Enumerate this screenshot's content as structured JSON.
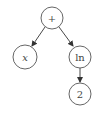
{
  "diagram": {
    "type": "expression-tree",
    "nodes": [
      {
        "id": "root",
        "label": "+",
        "italic": false,
        "cx": 52,
        "cy": 18,
        "r": 11
      },
      {
        "id": "x",
        "label": "x",
        "italic": true,
        "cx": 25,
        "cy": 57,
        "r": 12
      },
      {
        "id": "ln",
        "label": "ln",
        "italic": false,
        "cx": 80,
        "cy": 57,
        "r": 11
      },
      {
        "id": "two",
        "label": "2",
        "italic": false,
        "cx": 80,
        "cy": 94,
        "r": 11
      }
    ],
    "edges": [
      {
        "from": "root",
        "to": "x"
      },
      {
        "from": "root",
        "to": "ln"
      },
      {
        "from": "ln",
        "to": "two"
      }
    ]
  },
  "colors": {
    "stroke": "#555555",
    "text": "#444444",
    "background": "#ffffff"
  }
}
